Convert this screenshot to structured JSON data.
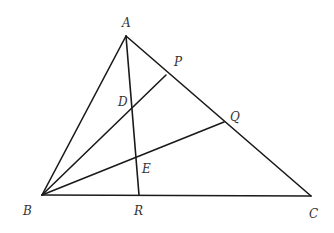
{
  "diagram": {
    "points": {
      "A": {
        "label": "A",
        "x": 126,
        "y": 36
      },
      "B": {
        "label": "B",
        "x": 42,
        "y": 195
      },
      "C": {
        "label": "C",
        "x": 311,
        "y": 196
      },
      "R": {
        "label": "R",
        "x": 139,
        "y": 195
      },
      "P": {
        "label": "P",
        "x": 166,
        "y": 75
      },
      "Q": {
        "label": "Q",
        "x": 224,
        "y": 122
      },
      "D": {
        "label": "D",
        "x": 132,
        "y": 107
      },
      "E": {
        "label": "E",
        "x": 137,
        "y": 156
      }
    },
    "segments": [
      "AB",
      "BC",
      "CA",
      "AR",
      "BP",
      "BQ"
    ],
    "stroke_color": "#1a1a1a"
  }
}
